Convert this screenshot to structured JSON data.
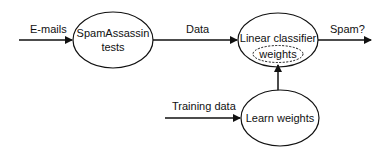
{
  "nodes": {
    "spamassassin": {
      "line1": "SpamAssassin",
      "line2": "tests"
    },
    "classifier": {
      "label": "Linear classifier",
      "inner": "weights"
    },
    "learn": {
      "label": "Learn weights"
    }
  },
  "edges": {
    "emails": "E-mails",
    "data": "Data",
    "spam": "Spam?",
    "training": "Training data"
  },
  "colors": {
    "stroke": "#111111",
    "background": "#ffffff"
  }
}
